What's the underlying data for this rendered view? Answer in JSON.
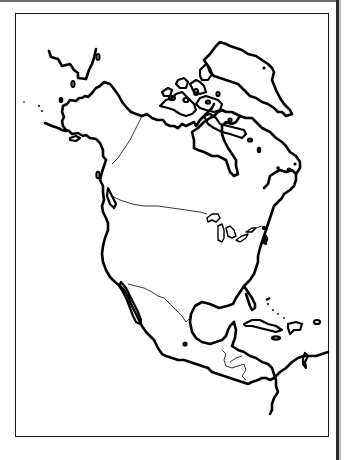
{
  "map": {
    "title": "",
    "type": "outline-map",
    "region": "North America",
    "style": "black-and-white outline",
    "frame_color": "#1a1a1a",
    "line_color": "#000000",
    "background": "#ffffff",
    "features": [
      {
        "id": "alaska",
        "kind": "landmass"
      },
      {
        "id": "canada",
        "kind": "landmass"
      },
      {
        "id": "arctic-archipelago",
        "kind": "island-group"
      },
      {
        "id": "greenland",
        "kind": "landmass"
      },
      {
        "id": "hudson-bay",
        "kind": "water-body"
      },
      {
        "id": "united-states",
        "kind": "landmass"
      },
      {
        "id": "great-lakes",
        "kind": "lake-group"
      },
      {
        "id": "mexico",
        "kind": "landmass"
      },
      {
        "id": "baja-california",
        "kind": "peninsula"
      },
      {
        "id": "gulf-of-mexico",
        "kind": "water-body"
      },
      {
        "id": "central-america",
        "kind": "landmass"
      },
      {
        "id": "caribbean-islands",
        "kind": "island-group"
      },
      {
        "id": "florida",
        "kind": "peninsula"
      }
    ],
    "borders": [
      {
        "id": "alaska-canada-border"
      },
      {
        "id": "us-canada-border"
      },
      {
        "id": "us-mexico-border"
      },
      {
        "id": "central-america-borders"
      }
    ],
    "markers": [
      {
        "id": "marker-mexico-city",
        "kind": "dot"
      },
      {
        "id": "marker-vancouver-island",
        "kind": "island"
      },
      {
        "id": "marker-east-coast-1",
        "kind": "dot"
      },
      {
        "id": "marker-east-coast-2",
        "kind": "dot"
      }
    ]
  }
}
